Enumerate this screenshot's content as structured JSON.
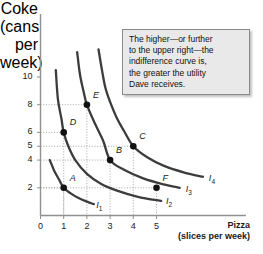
{
  "chart_data": {
    "type": "line",
    "title": "",
    "xlabel": "Pizza",
    "xlabel_sub": "(slices per week)",
    "ylabel_lines": [
      "Coke",
      "(cans",
      "per",
      "week)"
    ],
    "xlim": [
      0,
      6.2
    ],
    "ylim": [
      0,
      11.6
    ],
    "xticks": [
      "0",
      "1",
      "2",
      "3",
      "4",
      "5"
    ],
    "xtick_values": [
      0,
      1,
      2,
      3,
      4,
      5
    ],
    "yticks": [
      "2",
      "4",
      "5",
      "6",
      "8",
      "10"
    ],
    "ytick_values": [
      2,
      4,
      5,
      6,
      8,
      10
    ],
    "grid": "dotted-to-points",
    "legend_position": "inline-curve-end",
    "series": [
      {
        "name": "I1",
        "label": "I",
        "sub": "1",
        "utility_constant": 2,
        "points_xy": [
          [
            0.4,
            4.0
          ],
          [
            0.5,
            3.6
          ],
          [
            0.6,
            3.2
          ],
          [
            0.8,
            2.6
          ],
          [
            1.0,
            2.0
          ],
          [
            1.3,
            1.6
          ],
          [
            1.6,
            1.3
          ],
          [
            2.0,
            1.0
          ],
          [
            2.3,
            0.82
          ]
        ],
        "label_xy": [
          2.45,
          0.72
        ]
      },
      {
        "name": "I2",
        "label": "I",
        "sub": "2",
        "utility_constant": 6,
        "points_xy": [
          [
            0.66,
            10.5
          ],
          [
            0.75,
            8.4
          ],
          [
            0.9,
            7.0
          ],
          [
            1.0,
            6.0
          ],
          [
            1.2,
            5.0
          ],
          [
            1.5,
            4.0
          ],
          [
            2.0,
            3.0
          ],
          [
            2.6,
            2.3
          ],
          [
            3.3,
            1.8
          ],
          [
            4.2,
            1.35
          ],
          [
            5.2,
            1.05
          ]
        ],
        "label_xy": [
          5.45,
          0.95
        ]
      },
      {
        "name": "I3",
        "label": "I",
        "sub": "3",
        "utility_constant": 12,
        "points_xy": [
          [
            1.58,
            11.8
          ],
          [
            1.7,
            10.2
          ],
          [
            1.85,
            9.0
          ],
          [
            2.0,
            8.0
          ],
          [
            2.3,
            6.8
          ],
          [
            2.7,
            5.4
          ],
          [
            3.0,
            4.0
          ],
          [
            3.6,
            3.3
          ],
          [
            4.4,
            2.7
          ],
          [
            5.3,
            2.25
          ],
          [
            6.0,
            2.0
          ]
        ],
        "label_xy": [
          6.3,
          1.85
        ]
      },
      {
        "name": "I4",
        "label": "I",
        "sub": "4",
        "utility_constant": 20,
        "points_xy": [
          [
            2.5,
            12.0
          ],
          [
            2.65,
            10.5
          ],
          [
            2.8,
            9.2
          ],
          [
            3.0,
            8.2
          ],
          [
            3.3,
            7.0
          ],
          [
            3.6,
            6.1
          ],
          [
            4.0,
            5.0
          ],
          [
            4.6,
            4.2
          ],
          [
            5.3,
            3.6
          ],
          [
            6.2,
            3.1
          ],
          [
            7.0,
            2.8
          ]
        ],
        "label_xy": [
          7.3,
          2.65
        ]
      }
    ],
    "annotated_points": [
      {
        "label": "A",
        "x": 1,
        "y": 2,
        "curve": "I2",
        "label_offset": [
          6,
          -10
        ]
      },
      {
        "label": "B",
        "x": 3,
        "y": 4,
        "curve": "I3",
        "label_offset": [
          6,
          -10
        ]
      },
      {
        "label": "C",
        "x": 4,
        "y": 5,
        "curve": "I4",
        "label_offset": [
          6,
          -10
        ]
      },
      {
        "label": "D",
        "x": 1,
        "y": 6,
        "curve": "I2",
        "label_offset": [
          6,
          -10
        ]
      },
      {
        "label": "E",
        "x": 2,
        "y": 8,
        "curve": "I3",
        "label_offset": [
          6,
          -10
        ]
      },
      {
        "label": "F",
        "x": 5,
        "y": 2,
        "curve": "I3",
        "label_offset": [
          6,
          -10
        ]
      }
    ],
    "annotation": "The higher—or further to the upper right—the indifference curve is, the greater the utility Dave receives."
  },
  "callout": {
    "line1": "The higher—or further",
    "line2": "to the upper right—the",
    "line3": "indifference curve is,",
    "line4": "the greater the utility",
    "line5": "Dave receives."
  },
  "axes": {
    "y_title": "Coke\n(cans\nper\nweek)",
    "y_line1": "Coke",
    "y_line2": "(cans",
    "y_line3": "per",
    "y_line4": "week)",
    "x_title": "Pizza",
    "x_subtitle": "(slices per week)"
  },
  "colors": {
    "curve": "#3c3c3c",
    "axis": "#808080",
    "grid": "#9a9a9a",
    "point": "#111111",
    "callout_bg": "#e9e9e9",
    "callout_border": "#8a8a8a",
    "text": "#1a1a1a"
  }
}
